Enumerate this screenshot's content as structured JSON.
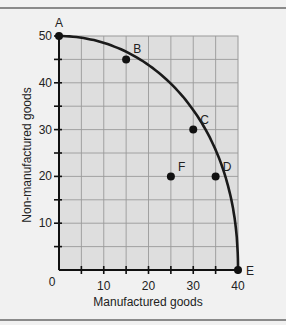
{
  "chart_data": {
    "type": "line",
    "title": "",
    "xlabel": "Manufactured goods",
    "ylabel": "Non-manufactured goods",
    "xlim": [
      0,
      40
    ],
    "ylim": [
      0,
      50
    ],
    "x_ticks": [
      0,
      10,
      20,
      30,
      40
    ],
    "y_ticks": [
      10,
      20,
      30,
      40,
      50
    ],
    "origin_label": "0",
    "grid": true,
    "grid_step": 5,
    "series": [
      {
        "name": "Production possibilities frontier",
        "points": [
          {
            "label": "A",
            "x": 0,
            "y": 50
          },
          {
            "label": "B",
            "x": 15,
            "y": 45
          },
          {
            "label": "C",
            "x": 30,
            "y": 30
          },
          {
            "label": "D",
            "x": 35,
            "y": 20
          },
          {
            "label": "E",
            "x": 40,
            "y": 0
          }
        ]
      },
      {
        "name": "Inside point",
        "points": [
          {
            "label": "F",
            "x": 25,
            "y": 20
          }
        ]
      }
    ],
    "colors": {
      "background": "#f1f1f1",
      "plot_area": "#dedede",
      "grid": "#9a9a9a",
      "curve": "#1a1a1a"
    }
  }
}
